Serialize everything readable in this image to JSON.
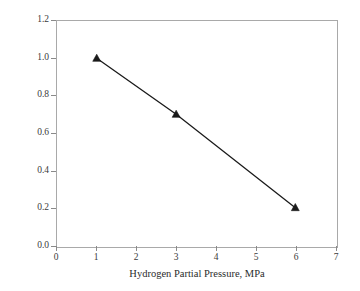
{
  "chart_data": {
    "type": "line",
    "title": "",
    "xlabel": "Hydrogen Partial Pressure, MPa",
    "ylabel": "Sludge, wt. %",
    "xlim": [
      0,
      7
    ],
    "ylim": [
      0.0,
      1.2
    ],
    "xticks": [
      0,
      1,
      2,
      3,
      4,
      5,
      6,
      7
    ],
    "xtick_labels": [
      "0",
      "1",
      "2",
      "3",
      "4",
      "5",
      "6",
      "7"
    ],
    "yticks": [
      0.0,
      0.2,
      0.4,
      0.6,
      0.8,
      1.0,
      1.2
    ],
    "ytick_labels": [
      "0.0",
      "0.2",
      "0.4",
      "0.6",
      "0.8",
      "1.0",
      "1.2"
    ],
    "grid": false,
    "legend": false,
    "marker": "triangle-up-filled",
    "line_color": "#1a1a1a",
    "marker_color": "#1a1a1a",
    "frame_color": "#a9a9a9",
    "background": "#ffffff",
    "x": [
      1,
      3,
      6
    ],
    "y": [
      1.0,
      0.7,
      0.2
    ],
    "series": [
      {
        "name": "Sludge",
        "points": [
          {
            "x": 1,
            "y": 1.0
          },
          {
            "x": 3,
            "y": 0.7
          },
          {
            "x": 6,
            "y": 0.2
          }
        ]
      }
    ]
  }
}
